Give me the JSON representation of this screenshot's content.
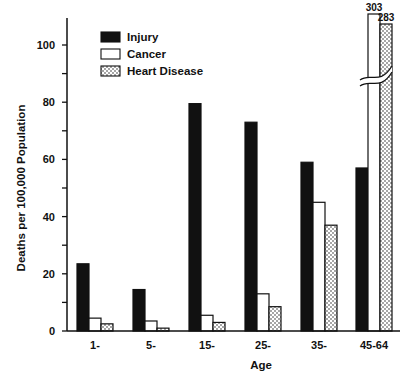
{
  "chart_data": {
    "type": "bar",
    "title": "",
    "xlabel": "Age",
    "ylabel": "Deaths per 100,000 Population",
    "ylim": [
      0,
      110
    ],
    "yticks": [
      0,
      20,
      40,
      60,
      80,
      100
    ],
    "grid": false,
    "legend_position": "upper-left inside plot",
    "categories": [
      "1-",
      "5-",
      "15-",
      "25-",
      "35-",
      "45-64"
    ],
    "series": [
      {
        "name": "Injury",
        "style": "solid-black",
        "values": [
          23.5,
          14.5,
          79.5,
          73,
          59,
          57
        ]
      },
      {
        "name": "Cancer",
        "style": "white-outlined",
        "values": [
          4.5,
          3.5,
          5.5,
          13,
          45,
          303
        ]
      },
      {
        "name": "Heart Disease",
        "style": "dotted",
        "values": [
          2.5,
          1,
          3,
          8.5,
          37,
          283
        ]
      }
    ],
    "annotations": [
      {
        "category": "45-64",
        "series": "Cancer",
        "text": "303",
        "note": "axis break"
      },
      {
        "category": "45-64",
        "series": "Heart Disease",
        "text": "283",
        "note": "axis break"
      }
    ]
  },
  "colors": {
    "injury": "#111111",
    "cancer": "#ffffff",
    "heart": "#ffffff",
    "stroke": "#111111"
  }
}
